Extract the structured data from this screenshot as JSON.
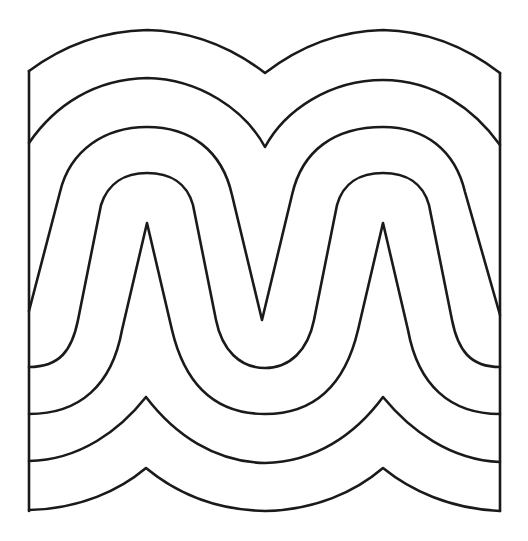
{
  "figure": {
    "stroke_color": "#1a1a1a",
    "background_color": "#ffffff",
    "curve_count": 7,
    "frame": {
      "left_x": 29,
      "right_x": 500,
      "bottom_y": 511
    }
  }
}
